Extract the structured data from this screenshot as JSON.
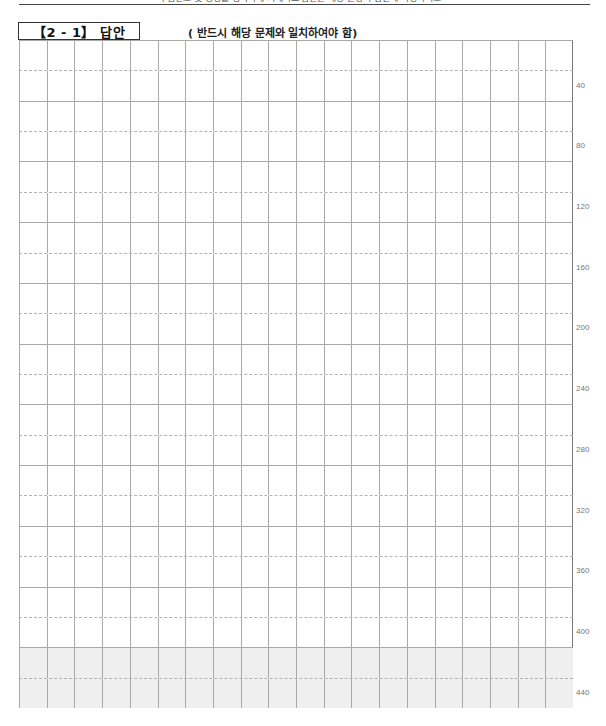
{
  "header": {
    "top_text_clipped": "수험번호 및 성명을 정확하게 기재하고 답안은 해당 문항의 답란에 작성하시오",
    "title": "【2 - 1】 답안",
    "subtitle": "( 반드시 해당 문제와 일치하여야 함)"
  },
  "grid": {
    "columns": 20,
    "rows": 22,
    "shaded_rows": [
      20,
      21
    ],
    "shade_color": "#efefef",
    "line_color": "#a9a9a9",
    "row_labels": [
      "40",
      "80",
      "120",
      "160",
      "200",
      "240",
      "280",
      "320",
      "360",
      "400",
      "440"
    ]
  }
}
